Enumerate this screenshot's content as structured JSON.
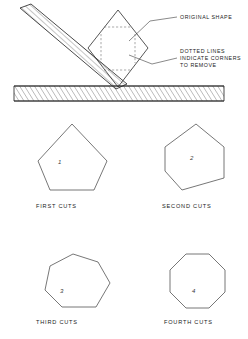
{
  "figure": {
    "ink_color": "#2b2b2b",
    "paper_color": "#ffffff",
    "dashed_color": "#6e6e6e"
  },
  "annotations": {
    "original_shape": "ORIGINAL SHAPE",
    "dotted_note_line1": "DOTTED LINES",
    "dotted_note_line2": "INDICATE CORNERS",
    "dotted_note_line3": "TO REMOVE"
  },
  "top_diagram": {
    "blade_label": "plane-blade",
    "base_label": "workbench-stock",
    "workpiece_label": "square-workpiece-diamond"
  },
  "steps": [
    {
      "number": "1",
      "caption": "FIRST CUTS",
      "sides": 5,
      "name": "first-cuts"
    },
    {
      "number": "2",
      "caption": "SECOND CUTS",
      "sides": 6,
      "name": "second-cuts"
    },
    {
      "number": "3",
      "caption": "THIRD CUTS",
      "sides": 7,
      "name": "third-cuts"
    },
    {
      "number": "4",
      "caption": "FOURTH CUTS",
      "sides": 8,
      "name": "fourth-cuts"
    }
  ]
}
